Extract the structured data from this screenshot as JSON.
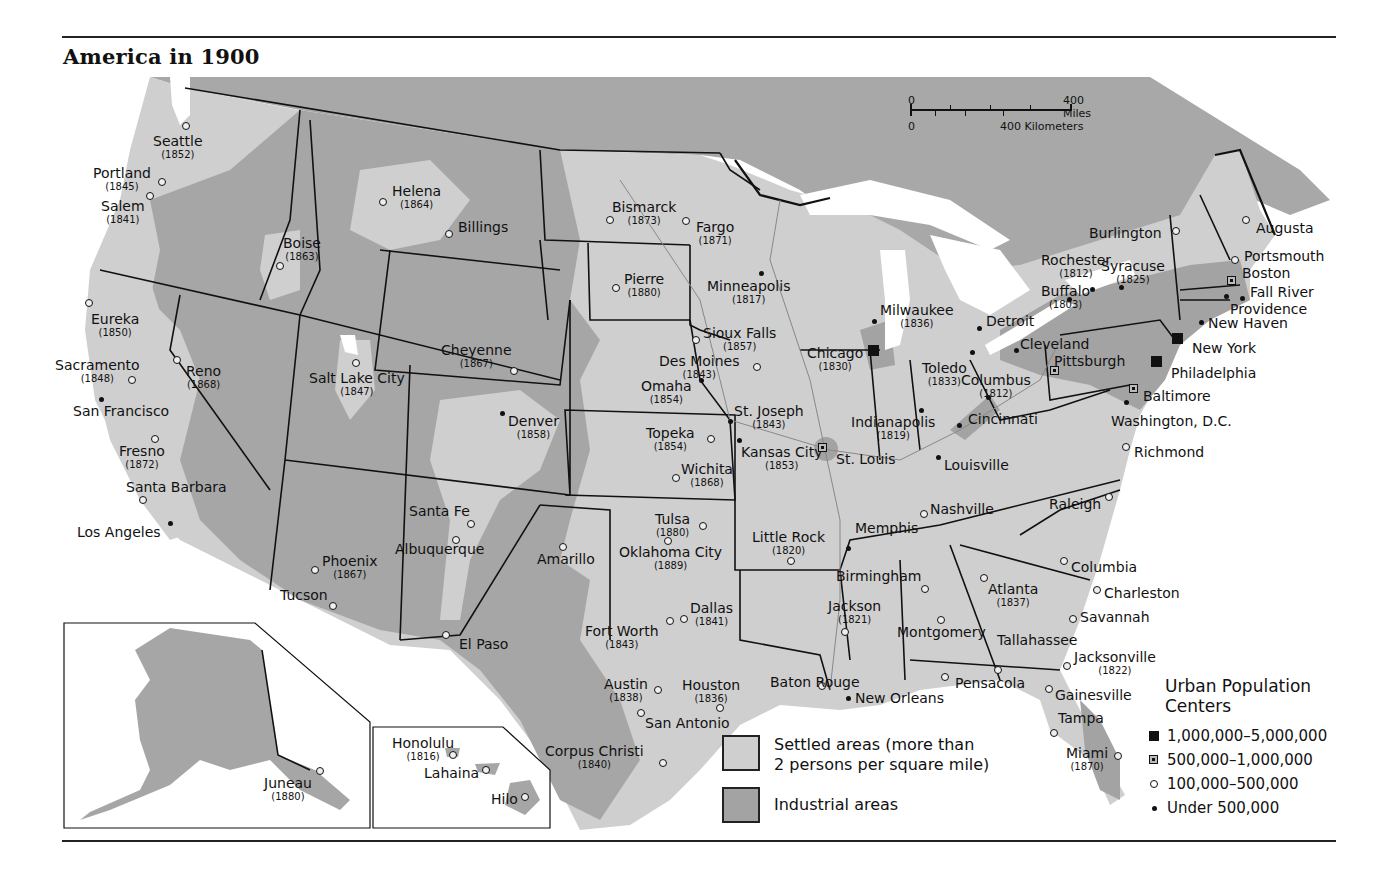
{
  "title": "America in 1900",
  "colors": {
    "canada": "#a8a8a8",
    "settled": "#cfcfcf",
    "industrial": "#a3a3a3",
    "unsettled": "#a6a6a6",
    "water": "#ffffff",
    "border": "#111111"
  },
  "scale_bar": {
    "miles_zero": "0",
    "miles_label": "400 Miles",
    "km_zero": "0",
    "km_label": "400 Kilometers"
  },
  "legend_areas": [
    {
      "id": "settled",
      "label_line1": "Settled areas (more than",
      "label_line2": "2 persons per square mile)",
      "color": "#cfcfcf"
    },
    {
      "id": "industrial",
      "label_line1": "Industrial areas",
      "label_line2": "",
      "color": "#a3a3a3"
    }
  ],
  "legend_urban": {
    "title_line1": "Urban Population",
    "title_line2": "Centers",
    "items": [
      {
        "symbol": "filled-square",
        "label": "1,000,000–5,000,000"
      },
      {
        "symbol": "dotted-square",
        "label": "500,000–1,000,000"
      },
      {
        "symbol": "open-circle",
        "label": "100,000–500,000"
      },
      {
        "symbol": "dot",
        "label": "Under 500,000"
      }
    ]
  },
  "cities": [
    {
      "name": "Seattle",
      "year": "(1852)",
      "marker": "small",
      "mx": 186,
      "my": 126,
      "lx": 153,
      "ly": 134
    },
    {
      "name": "Portland",
      "year": "(1845)",
      "marker": "small",
      "mx": 162,
      "my": 182,
      "lx": 93,
      "ly": 166
    },
    {
      "name": "Salem",
      "year": "(1841)",
      "marker": "small",
      "mx": 150,
      "my": 196,
      "lx": 101,
      "ly": 199
    },
    {
      "name": "Helena",
      "year": "(1864)",
      "marker": "small",
      "mx": 383,
      "my": 202,
      "lx": 392,
      "ly": 184
    },
    {
      "name": "Billings",
      "year": "",
      "marker": "small",
      "mx": 449,
      "my": 234,
      "lx": 458,
      "ly": 220
    },
    {
      "name": "Boise",
      "year": "(1863)",
      "marker": "small",
      "mx": 280,
      "my": 266,
      "lx": 283,
      "ly": 236
    },
    {
      "name": "Eureka",
      "year": "(1850)",
      "marker": "small",
      "mx": 89,
      "my": 303,
      "lx": 91,
      "ly": 312
    },
    {
      "name": "Sacramento",
      "year": "(1848)",
      "marker": "small",
      "mx": 132,
      "my": 380,
      "lx": 55,
      "ly": 358
    },
    {
      "name": "Reno",
      "year": "(1868)",
      "marker": "small",
      "mx": 177,
      "my": 360,
      "lx": 186,
      "ly": 364
    },
    {
      "name": "San Francisco",
      "year": "",
      "marker": "tiny",
      "mx": 101,
      "my": 399,
      "lx": 73,
      "ly": 404
    },
    {
      "name": "Fresno",
      "year": "(1872)",
      "marker": "small",
      "mx": 155,
      "my": 439,
      "lx": 119,
      "ly": 444
    },
    {
      "name": "Santa Barbara",
      "year": "",
      "marker": "small",
      "mx": 143,
      "my": 500,
      "lx": 126,
      "ly": 480
    },
    {
      "name": "Los Angeles",
      "year": "",
      "marker": "tiny",
      "mx": 170,
      "my": 523,
      "lx": 77,
      "ly": 525
    },
    {
      "name": "Salt Lake City",
      "year": "(1847)",
      "marker": "small",
      "mx": 356,
      "my": 363,
      "lx": 309,
      "ly": 371
    },
    {
      "name": "Cheyenne",
      "year": "(1867)",
      "marker": "small",
      "mx": 514,
      "my": 371,
      "lx": 441,
      "ly": 343
    },
    {
      "name": "Denver",
      "year": "(1858)",
      "marker": "tiny",
      "mx": 502,
      "my": 413,
      "lx": 508,
      "ly": 414
    },
    {
      "name": "Santa Fe",
      "year": "",
      "marker": "small",
      "mx": 471,
      "my": 524,
      "lx": 409,
      "ly": 504
    },
    {
      "name": "Albuquerque",
      "year": "",
      "marker": "small",
      "mx": 456,
      "my": 540,
      "lx": 395,
      "ly": 542
    },
    {
      "name": "Amarillo",
      "year": "",
      "marker": "small",
      "mx": 563,
      "my": 547,
      "lx": 537,
      "ly": 552
    },
    {
      "name": "Phoenix",
      "year": "(1867)",
      "marker": "small",
      "mx": 315,
      "my": 570,
      "lx": 322,
      "ly": 554
    },
    {
      "name": "Tucson",
      "year": "",
      "marker": "small",
      "mx": 333,
      "my": 606,
      "lx": 280,
      "ly": 588
    },
    {
      "name": "El Paso",
      "year": "",
      "marker": "small",
      "mx": 446,
      "my": 635,
      "lx": 459,
      "ly": 637
    },
    {
      "name": "Bismarck",
      "year": "(1873)",
      "marker": "small",
      "mx": 610,
      "my": 220,
      "lx": 612,
      "ly": 200
    },
    {
      "name": "Fargo",
      "year": "(1871)",
      "marker": "small",
      "mx": 686,
      "my": 221,
      "lx": 696,
      "ly": 220
    },
    {
      "name": "Pierre",
      "year": "(1880)",
      "marker": "small",
      "mx": 616,
      "my": 288,
      "lx": 624,
      "ly": 272
    },
    {
      "name": "Minneapolis",
      "year": "(1817)",
      "marker": "tiny",
      "mx": 761,
      "my": 273,
      "lx": 707,
      "ly": 279
    },
    {
      "name": "Sioux Falls",
      "year": "(1857)",
      "marker": "small",
      "mx": 696,
      "my": 340,
      "lx": 703,
      "ly": 326
    },
    {
      "name": "Des Moines",
      "year": "(1843)",
      "marker": "small",
      "mx": 757,
      "my": 367,
      "lx": 659,
      "ly": 354
    },
    {
      "name": "Omaha",
      "year": "(1854)",
      "marker": "tiny",
      "mx": 701,
      "my": 380,
      "lx": 641,
      "ly": 379
    },
    {
      "name": "St. Joseph",
      "year": "(1843)",
      "marker": "tiny",
      "mx": 730,
      "my": 421,
      "lx": 734,
      "ly": 404
    },
    {
      "name": "Topeka",
      "year": "(1854)",
      "marker": "small",
      "mx": 711,
      "my": 439,
      "lx": 646,
      "ly": 426
    },
    {
      "name": "Kansas City",
      "year": "(1853)",
      "marker": "tiny",
      "mx": 739,
      "my": 440,
      "lx": 741,
      "ly": 445
    },
    {
      "name": "Wichita",
      "year": "(1868)",
      "marker": "small",
      "mx": 676,
      "my": 478,
      "lx": 681,
      "ly": 462
    },
    {
      "name": "Tulsa",
      "year": "(1880)",
      "marker": "small",
      "mx": 703,
      "my": 526,
      "lx": 655,
      "ly": 512
    },
    {
      "name": "Oklahoma City",
      "year": "(1889)",
      "marker": "small",
      "mx": 668,
      "my": 541,
      "lx": 619,
      "ly": 545
    },
    {
      "name": "Little Rock",
      "year": "(1820)",
      "marker": "small",
      "mx": 791,
      "my": 561,
      "lx": 752,
      "ly": 530
    },
    {
      "name": "Dallas",
      "year": "(1841)",
      "marker": "small",
      "mx": 684,
      "my": 619,
      "lx": 690,
      "ly": 601
    },
    {
      "name": "Fort Worth",
      "year": "(1843)",
      "marker": "small",
      "mx": 670,
      "my": 621,
      "lx": 585,
      "ly": 624
    },
    {
      "name": "Austin",
      "year": "(1838)",
      "marker": "small",
      "mx": 658,
      "my": 690,
      "lx": 604,
      "ly": 677
    },
    {
      "name": "Houston",
      "year": "(1836)",
      "marker": "small",
      "mx": 720,
      "my": 708,
      "lx": 682,
      "ly": 678
    },
    {
      "name": "San Antonio",
      "year": "",
      "marker": "small",
      "mx": 641,
      "my": 713,
      "lx": 645,
      "ly": 716
    },
    {
      "name": "Corpus Christi",
      "year": "(1840)",
      "marker": "small",
      "mx": 663,
      "my": 763,
      "lx": 545,
      "ly": 744
    },
    {
      "name": "Baton Rouge",
      "year": "",
      "marker": "small",
      "mx": 822,
      "my": 686,
      "lx": 770,
      "ly": 675
    },
    {
      "name": "New Orleans",
      "year": "",
      "marker": "tiny",
      "mx": 848,
      "my": 698,
      "lx": 855,
      "ly": 691
    },
    {
      "name": "Jackson",
      "year": "(1821)",
      "marker": "small",
      "mx": 845,
      "my": 632,
      "lx": 828,
      "ly": 599
    },
    {
      "name": "Memphis",
      "year": "",
      "marker": "tiny",
      "mx": 848,
      "my": 548,
      "lx": 855,
      "ly": 521
    },
    {
      "name": "Birmingham",
      "year": "",
      "marker": "small",
      "mx": 925,
      "my": 589,
      "lx": 836,
      "ly": 569
    },
    {
      "name": "Montgomery",
      "year": "",
      "marker": "small",
      "mx": 941,
      "my": 620,
      "lx": 897,
      "ly": 625
    },
    {
      "name": "Nashville",
      "year": "",
      "marker": "small",
      "mx": 924,
      "my": 514,
      "lx": 930,
      "ly": 502
    },
    {
      "name": "Atlanta",
      "year": "(1837)",
      "marker": "small",
      "mx": 984,
      "my": 578,
      "lx": 988,
      "ly": 582
    },
    {
      "name": "Tallahassee",
      "year": "",
      "marker": "small",
      "mx": 998,
      "my": 670,
      "lx": 997,
      "ly": 633
    },
    {
      "name": "Pensacola",
      "year": "",
      "marker": "small",
      "mx": 945,
      "my": 677,
      "lx": 955,
      "ly": 676
    },
    {
      "name": "Jacksonville",
      "year": "(1822)",
      "marker": "small",
      "mx": 1067,
      "my": 666,
      "lx": 1074,
      "ly": 650
    },
    {
      "name": "Gainesville",
      "year": "",
      "marker": "small",
      "mx": 1049,
      "my": 689,
      "lx": 1055,
      "ly": 688
    },
    {
      "name": "Tampa",
      "year": "",
      "marker": "small",
      "mx": 1054,
      "my": 733,
      "lx": 1058,
      "ly": 711
    },
    {
      "name": "Miami",
      "year": "(1870)",
      "marker": "small",
      "mx": 1118,
      "my": 756,
      "lx": 1066,
      "ly": 746
    },
    {
      "name": "Columbia",
      "year": "",
      "marker": "small",
      "mx": 1064,
      "my": 561,
      "lx": 1071,
      "ly": 560
    },
    {
      "name": "Charleston",
      "year": "",
      "marker": "small",
      "mx": 1097,
      "my": 590,
      "lx": 1104,
      "ly": 586
    },
    {
      "name": "Savannah",
      "year": "",
      "marker": "small",
      "mx": 1073,
      "my": 619,
      "lx": 1080,
      "ly": 610
    },
    {
      "name": "Raleigh",
      "year": "",
      "marker": "small",
      "mx": 1109,
      "my": 497,
      "lx": 1049,
      "ly": 497
    },
    {
      "name": "Richmond",
      "year": "",
      "marker": "small",
      "mx": 1126,
      "my": 447,
      "lx": 1134,
      "ly": 445
    },
    {
      "name": "Louisville",
      "year": "",
      "marker": "tiny",
      "mx": 938,
      "my": 457,
      "lx": 944,
      "ly": 458
    },
    {
      "name": "St. Louis",
      "year": "",
      "marker": "mid",
      "mx": 822,
      "my": 447,
      "lx": 836,
      "ly": 452
    },
    {
      "name": "Indianapolis",
      "year": "(1819)",
      "marker": "tiny",
      "mx": 921,
      "my": 410,
      "lx": 851,
      "ly": 415
    },
    {
      "name": "Cincinnati",
      "year": "",
      "marker": "tiny",
      "mx": 959,
      "my": 425,
      "lx": 968,
      "ly": 412
    },
    {
      "name": "Columbus",
      "year": "(1812)",
      "marker": "tiny",
      "mx": 988,
      "my": 397,
      "lx": 961,
      "ly": 373
    },
    {
      "name": "Chicago",
      "year": "(1830)",
      "marker": "big",
      "mx": 873,
      "my": 350,
      "lx": 807,
      "ly": 346
    },
    {
      "name": "Milwaukee",
      "year": "(1836)",
      "marker": "tiny",
      "mx": 874,
      "my": 321,
      "lx": 880,
      "ly": 303
    },
    {
      "name": "Detroit",
      "year": "",
      "marker": "tiny",
      "mx": 979,
      "my": 328,
      "lx": 986,
      "ly": 314
    },
    {
      "name": "Toledo",
      "year": "(1833)",
      "marker": "tiny",
      "mx": 972,
      "my": 352,
      "lx": 922,
      "ly": 361
    },
    {
      "name": "Cleveland",
      "year": "",
      "marker": "tiny",
      "mx": 1016,
      "my": 350,
      "lx": 1020,
      "ly": 337
    },
    {
      "name": "Pittsburgh",
      "year": "",
      "marker": "mid",
      "mx": 1054,
      "my": 370,
      "lx": 1054,
      "ly": 354
    },
    {
      "name": "Buffalo",
      "year": "(1803)",
      "marker": "tiny",
      "mx": 1069,
      "my": 299,
      "lx": 1041,
      "ly": 284
    },
    {
      "name": "Rochester",
      "year": "(1812)",
      "marker": "tiny",
      "mx": 1092,
      "my": 289,
      "lx": 1041,
      "ly": 253
    },
    {
      "name": "Syracuse",
      "year": "(1825)",
      "marker": "tiny",
      "mx": 1121,
      "my": 287,
      "lx": 1101,
      "ly": 259
    },
    {
      "name": "Burlington",
      "year": "",
      "marker": "small",
      "mx": 1176,
      "my": 231,
      "lx": 1089,
      "ly": 226
    },
    {
      "name": "Augusta",
      "year": "",
      "marker": "small",
      "mx": 1246,
      "my": 220,
      "lx": 1256,
      "ly": 221
    },
    {
      "name": "Portsmouth",
      "year": "",
      "marker": "small",
      "mx": 1235,
      "my": 260,
      "lx": 1244,
      "ly": 249
    },
    {
      "name": "Boston",
      "year": "",
      "marker": "mid",
      "mx": 1231,
      "my": 280,
      "lx": 1242,
      "ly": 266
    },
    {
      "name": "Fall River",
      "year": "",
      "marker": "tiny",
      "mx": 1242,
      "my": 298,
      "lx": 1250,
      "ly": 285
    },
    {
      "name": "Providence",
      "year": "",
      "marker": "tiny",
      "mx": 1226,
      "my": 296,
      "lx": 1230,
      "ly": 302
    },
    {
      "name": "New Haven",
      "year": "",
      "marker": "tiny",
      "mx": 1201,
      "my": 322,
      "lx": 1208,
      "ly": 316
    },
    {
      "name": "New York",
      "year": "",
      "marker": "big",
      "mx": 1177,
      "my": 338,
      "lx": 1192,
      "ly": 341
    },
    {
      "name": "Philadelphia",
      "year": "",
      "marker": "big",
      "mx": 1156,
      "my": 361,
      "lx": 1171,
      "ly": 366
    },
    {
      "name": "Baltimore",
      "year": "",
      "marker": "mid",
      "mx": 1133,
      "my": 388,
      "lx": 1143,
      "ly": 389
    },
    {
      "name": "Washington, D.C.",
      "year": "",
      "marker": "tiny",
      "mx": 1126,
      "my": 402,
      "lx": 1111,
      "ly": 414
    },
    {
      "name": "Juneau",
      "year": "(1880)",
      "marker": "small",
      "mx": 320,
      "my": 771,
      "lx": 264,
      "ly": 776
    },
    {
      "name": "Honolulu",
      "year": "(1816)",
      "marker": "small",
      "mx": 453,
      "my": 755,
      "lx": 392,
      "ly": 736
    },
    {
      "name": "Lahaina",
      "year": "",
      "marker": "small",
      "mx": 486,
      "my": 770,
      "lx": 424,
      "ly": 766
    },
    {
      "name": "Hilo",
      "year": "",
      "marker": "small",
      "mx": 525,
      "my": 797,
      "lx": 491,
      "ly": 792
    }
  ]
}
